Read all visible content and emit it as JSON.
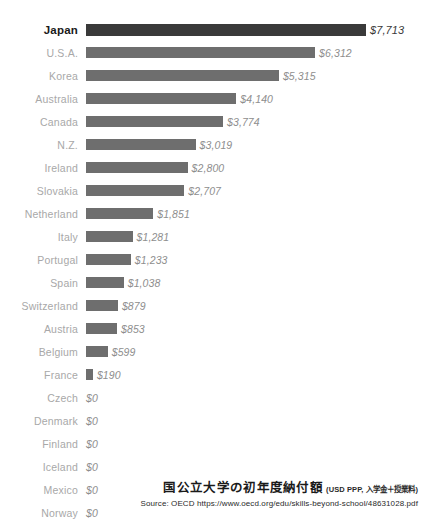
{
  "chart_data": {
    "type": "bar",
    "orientation": "horizontal",
    "title": "国公立大学の初年度納付額",
    "subtitle": "(USD PPP, 入学金＋授業料)",
    "source": "Source: OECD https://www.oecd.org/edu/skills-beyond-school/48631028.pdf",
    "xlabel": "",
    "ylabel": "",
    "grid": false,
    "legend": false,
    "xlim": [
      0,
      7713
    ],
    "highlight_category": "Japan",
    "categories": [
      "Japan",
      "U.S.A.",
      "Korea",
      "Australia",
      "Canada",
      "N.Z.",
      "Ireland",
      "Slovakia",
      "Netherland",
      "Italy",
      "Portugal",
      "Spain",
      "Switzerland",
      "Austria",
      "Belgium",
      "France",
      "Czech",
      "Denmark",
      "Finland",
      "Iceland",
      "Mexico",
      "Norway",
      "Sweden"
    ],
    "values": [
      7713,
      6312,
      5315,
      4140,
      3774,
      3019,
      2800,
      2707,
      1851,
      1281,
      1233,
      1038,
      879,
      853,
      599,
      190,
      0,
      0,
      0,
      0,
      0,
      0,
      0
    ],
    "value_labels": [
      "$7,713",
      "$6,312",
      "$5,315",
      "$4,140",
      "$3,774",
      "$3,019",
      "$2,800",
      "$2,707",
      "$1,851",
      "$1,281",
      "$1,233",
      "$1,038",
      "$879",
      "$853",
      "$599",
      "$190",
      "$0",
      "$0",
      "$0",
      "$0",
      "$0",
      "$0",
      "$0"
    ]
  },
  "colors": {
    "bar": "#6e6e6e",
    "bar_highlight": "#3a3a3a",
    "label": "#a8a8a8",
    "label_highlight": "#1a1a1a",
    "value": "#8e8e8e",
    "background": "#ffffff"
  }
}
